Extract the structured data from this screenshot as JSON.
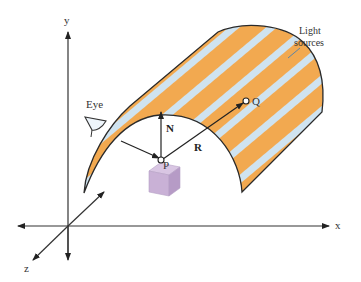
{
  "diagram": {
    "axes": {
      "x_label": "x",
      "y_label": "y",
      "z_label": "z"
    },
    "labels": {
      "eye": "Eye",
      "light_line1": "Light",
      "light_line2": "sources",
      "point_p": "P",
      "point_q": "Q",
      "normal": "N",
      "reflect": "R"
    },
    "colors": {
      "stripe_orange": "#F2A950",
      "stripe_blue": "#CFE3F0",
      "outline": "#2a2a2a",
      "cube_fill": "#C9B1D6",
      "cube_side": "#B69BC6",
      "cube_top": "#D9C6E3",
      "axis": "#333333",
      "text": "#333333"
    }
  }
}
